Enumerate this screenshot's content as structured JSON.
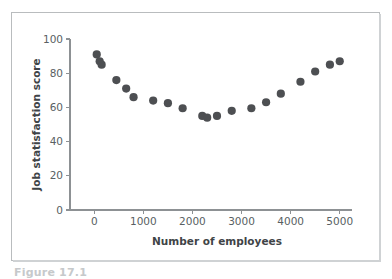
{
  "figure": {
    "caption_partial": "Figure 17.1"
  },
  "chart_data": {
    "type": "scatter",
    "title": "",
    "xlabel": "Number of employees",
    "ylabel": "Job statisfaction score",
    "xlim": [
      -250,
      5250
    ],
    "ylim": [
      0,
      100
    ],
    "xticks": [
      0,
      1000,
      2000,
      3000,
      4000,
      5000
    ],
    "xtick_labels": [
      "0",
      "1000",
      "2000",
      "3000",
      "4000",
      "5000"
    ],
    "yticks": [
      0,
      20,
      40,
      60,
      80,
      100
    ],
    "ytick_labels": [
      "0",
      "20",
      "40",
      "60",
      "80",
      "100"
    ],
    "grid": false,
    "legend": false,
    "marker": {
      "shape": "circle",
      "color": "#4d4f52",
      "size": 4.1
    },
    "series": [
      {
        "name": "Job satisfaction vs company size",
        "x": [
          50,
          110,
          150,
          450,
          650,
          800,
          1200,
          1500,
          1800,
          2200,
          2300,
          2500,
          2800,
          3200,
          3500,
          3800,
          4200,
          4500,
          4800,
          5000
        ],
        "y": [
          91,
          87,
          85,
          76,
          71,
          66,
          64,
          62.5,
          59.5,
          55,
          54,
          55,
          58,
          59.5,
          63,
          68,
          75,
          81,
          85,
          87
        ]
      }
    ]
  }
}
